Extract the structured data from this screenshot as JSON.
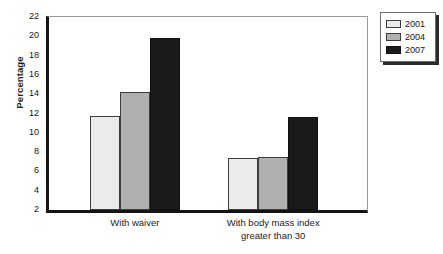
{
  "chart_data": {
    "type": "bar",
    "title": "",
    "xlabel": "",
    "ylabel": "Percentage",
    "ylim": [
      2,
      22
    ],
    "ytick_step": 2,
    "yticks": [
      2,
      4,
      6,
      8,
      10,
      12,
      14,
      16,
      18,
      20,
      22
    ],
    "grid": false,
    "legend_position": "top-right",
    "categories": [
      "With waiver",
      "With body mass index\ngreater than 30"
    ],
    "series": [
      {
        "name": "2001",
        "color": "#ebebeb",
        "values": [
          11.75,
          7.4
        ]
      },
      {
        "name": "2004",
        "color": "#b0b0b0",
        "values": [
          14.2,
          7.45
        ]
      },
      {
        "name": "2007",
        "color": "#1a1a1a",
        "values": [
          19.85,
          11.6
        ]
      }
    ]
  },
  "axis": {
    "y_title": "Percentage"
  },
  "legend": {
    "entries": [
      {
        "label": "2001",
        "color": "#ebebeb"
      },
      {
        "label": "2004",
        "color": "#b0b0b0"
      },
      {
        "label": "2007",
        "color": "#1a1a1a"
      }
    ]
  },
  "colors": {
    "axis": "#141414",
    "frame": "#9a9a9a",
    "text": "#1b1b1b",
    "background": "#ffffff"
  }
}
